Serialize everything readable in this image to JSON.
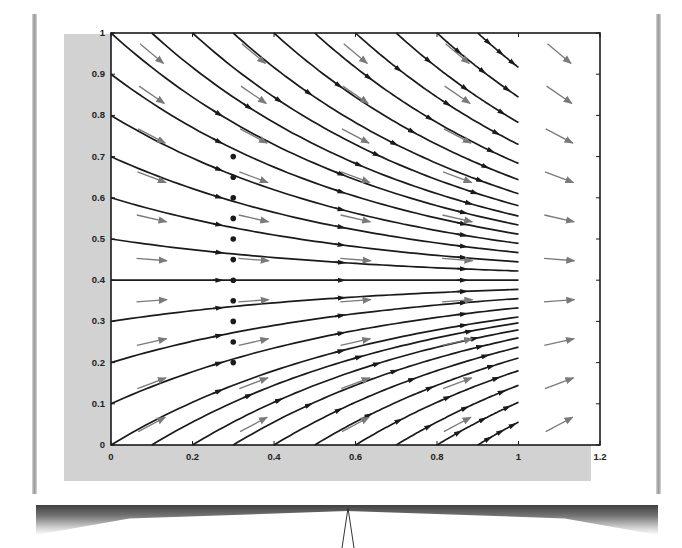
{
  "chart_data": {
    "type": "streamline",
    "title": "",
    "xlabel": "",
    "ylabel": "",
    "xlim": [
      0,
      1.2
    ],
    "ylim": [
      0,
      1
    ],
    "grid": false,
    "x_ticks": [
      "0",
      "0.2",
      "0.4",
      "0.6",
      "0.8",
      "1",
      "1.2"
    ],
    "x_tick_values": [
      0,
      0.2,
      0.4,
      0.6,
      0.8,
      1,
      1.2
    ],
    "y_ticks": [
      "0",
      "0.1",
      "0.2",
      "0.3",
      "0.4",
      "0.5",
      "0.6",
      "0.7",
      "0.8",
      "0.9",
      "1"
    ],
    "y_tick_values": [
      0,
      0.1,
      0.2,
      0.3,
      0.4,
      0.5,
      0.6,
      0.7,
      0.8,
      0.9,
      1
    ],
    "field": {
      "equation": "dy/dx = k (0.4 - y)",
      "k": 1.5,
      "equilibrium_y": 0.4
    },
    "streamline_end_x": 1.0,
    "streamline_starts": {
      "left_edge_y": [
        0,
        0.1,
        0.2,
        0.3,
        0.4,
        0.5,
        0.6,
        0.7,
        0.8,
        0.9,
        1.0
      ],
      "top_edge_x": [
        0.1,
        0.2,
        0.3,
        0.4,
        0.5,
        0.6,
        0.7,
        0.8,
        0.9
      ],
      "bottom_edge_x": [
        0.1,
        0.2,
        0.3,
        0.4,
        0.5,
        0.6,
        0.7,
        0.8,
        0.9
      ]
    },
    "highlighted_points_x": 0.3,
    "highlighted_points_y": [
      0.2,
      0.25,
      0.3,
      0.35,
      0.4,
      0.45,
      0.5,
      0.55,
      0.6,
      0.65,
      0.7
    ],
    "quiver": {
      "x": [
        0.1,
        0.35,
        0.6,
        0.85,
        1.1
      ],
      "y": [
        0.05,
        0.15,
        0.25,
        0.35,
        0.45,
        0.55,
        0.65,
        0.75,
        0.85,
        0.95
      ],
      "color": "#808080"
    },
    "colors": {
      "streamline": "#1a1a1a",
      "arrow": "#7a7a7a",
      "panel": "#d2d2d2",
      "axes_bg": "#ffffff"
    }
  }
}
